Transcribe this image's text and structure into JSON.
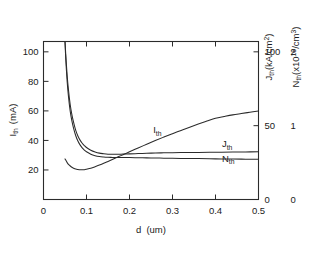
{
  "chart_data": {
    "type": "line",
    "title": "",
    "xlabel": "d  (um)",
    "ylabel_left": "I_th  (mA)",
    "ylabel_right_1": "J_th(kA/cm2)",
    "ylabel_right_2": "N_th(x1018/cm3)",
    "grid": false,
    "legend_position": "inline-labels",
    "xlim": [
      0,
      0.5
    ],
    "ylim_left": [
      0,
      107
    ],
    "ylim_right_1": [
      0,
      107
    ],
    "ylim_right_2": [
      0,
      2.14
    ],
    "xticks": [
      "0",
      "0.1",
      "0.2",
      "0.3",
      "0.4",
      "0.5"
    ],
    "xtick_values": [
      0,
      0.1,
      0.2,
      0.3,
      0.4,
      0.5
    ],
    "yticks_left": [
      "20",
      "40",
      "60",
      "80",
      "100"
    ],
    "ytick_values_left": [
      20,
      40,
      60,
      80,
      100
    ],
    "yticks_right_1": [
      "0",
      "50",
      "100"
    ],
    "ytick_values_right_1": [
      0,
      50,
      100
    ],
    "yticks_right_2": [
      "0",
      "1",
      "2"
    ],
    "ytick_values_right_2": [
      0,
      1,
      2
    ],
    "series": [
      {
        "name": "I_th",
        "label": "I_th",
        "label_x": 0.255,
        "label_y": 45,
        "axis": "left",
        "units": "mA",
        "x": [
          0.05,
          0.055,
          0.06,
          0.065,
          0.07,
          0.075,
          0.08,
          0.085,
          0.09,
          0.095,
          0.1,
          0.11,
          0.12,
          0.13,
          0.14,
          0.15,
          0.16,
          0.17,
          0.18,
          0.19,
          0.2,
          0.22,
          0.24,
          0.26,
          0.28,
          0.3,
          0.32,
          0.34,
          0.36,
          0.38,
          0.4,
          0.42,
          0.44,
          0.46,
          0.48,
          0.5
        ],
        "y": [
          27.5,
          25.0,
          23.2,
          22.0,
          21.2,
          20.6,
          20.3,
          20.1,
          20.1,
          20.2,
          20.5,
          21.2,
          22.2,
          23.3,
          24.5,
          25.8,
          27.1,
          28.4,
          29.7,
          31.0,
          32.3,
          34.9,
          37.4,
          39.9,
          42.3,
          44.6,
          46.8,
          49.0,
          51.1,
          53.1,
          55.0,
          56.2,
          57.3,
          58.2,
          59.1,
          59.9
        ]
      },
      {
        "name": "J_th",
        "label": "J_th",
        "label_x": 0.415,
        "label_y": 35.5,
        "axis": "right-1",
        "units": "kA/cm2",
        "x": [
          0.05,
          0.052,
          0.055,
          0.058,
          0.062,
          0.066,
          0.07,
          0.075,
          0.08,
          0.085,
          0.09,
          0.095,
          0.1,
          0.11,
          0.12,
          0.13,
          0.14,
          0.15,
          0.16,
          0.17,
          0.18,
          0.19,
          0.2,
          0.22,
          0.24,
          0.26,
          0.28,
          0.3,
          0.33,
          0.36,
          0.4,
          0.44,
          0.47,
          0.5
        ],
        "y": [
          107.0,
          97.0,
          84.0,
          74.5,
          64.5,
          57.5,
          52.2,
          46.8,
          43.0,
          40.2,
          38.1,
          36.5,
          35.2,
          33.4,
          32.2,
          31.4,
          31.0,
          30.7,
          30.6,
          30.6,
          30.7,
          30.8,
          30.9,
          31.1,
          31.3,
          31.5,
          31.6,
          31.7,
          31.8,
          31.9,
          32.0,
          32.1,
          32.2,
          32.3
        ]
      },
      {
        "name": "N_th",
        "label": "N_th",
        "label_x": 0.415,
        "label_y": 25.5,
        "axis": "right-2",
        "units": "x1018/cm3",
        "x": [
          0.05,
          0.052,
          0.055,
          0.058,
          0.062,
          0.066,
          0.07,
          0.075,
          0.08,
          0.085,
          0.09,
          0.095,
          0.1,
          0.11,
          0.12,
          0.13,
          0.14,
          0.15,
          0.16,
          0.17,
          0.18,
          0.19,
          0.2,
          0.22,
          0.24,
          0.26,
          0.28,
          0.3,
          0.33,
          0.36,
          0.4,
          0.44,
          0.47,
          0.5
        ],
        "y": [
          107.0,
          94.0,
          80.0,
          70.0,
          60.0,
          53.2,
          48.2,
          43.2,
          39.6,
          37.0,
          35.0,
          33.5,
          32.3,
          30.7,
          29.7,
          29.1,
          28.8,
          28.6,
          28.5,
          28.4,
          28.4,
          28.4,
          28.4,
          28.3,
          28.2,
          28.1,
          28.0,
          27.9,
          27.8,
          27.7,
          27.5,
          27.4,
          27.3,
          27.2
        ]
      }
    ]
  },
  "axes": {
    "x_title_main": "d",
    "x_title_unit": "(um)",
    "left_title_main": "I",
    "left_title_sub": "th",
    "left_title_unit": "(mA)",
    "right1_title_main": "J",
    "right1_title_sub": "th",
    "right1_title_unit": "(kA/cm",
    "right1_title_sup": "2",
    "right1_title_close": ")",
    "right2_title_main": "N",
    "right2_title_sub": "th",
    "right2_title_unit": "(x10",
    "right2_title_sup": "18",
    "right2_title_close": "/cm",
    "right2_title_sup2": "3",
    "right2_title_close2": ")"
  },
  "labels": {
    "ith_main": "I",
    "ith_sub": "th",
    "jth_main": "J",
    "jth_sub": "th",
    "nth_main": "N",
    "nth_sub": "th"
  },
  "style": {
    "line_color": "#2b2b2b",
    "text_color": "#1a1a1a",
    "background": "#ffffff"
  }
}
